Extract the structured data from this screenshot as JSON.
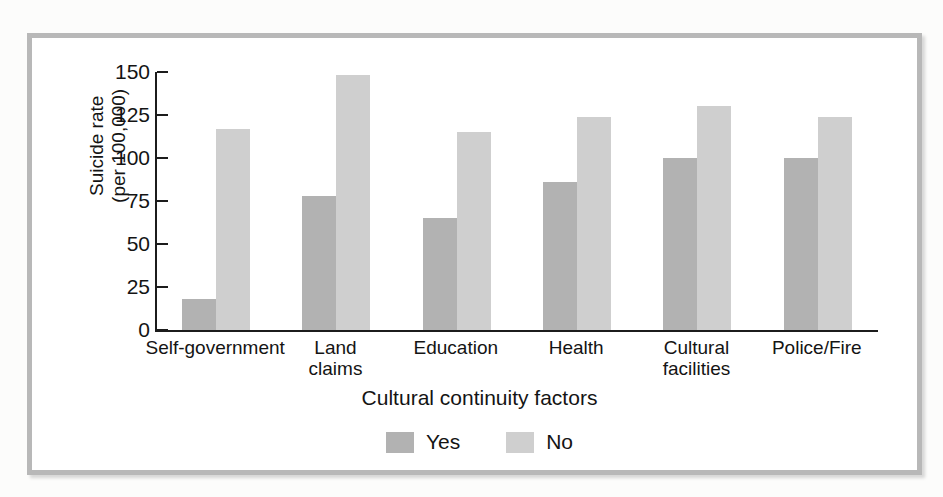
{
  "chart_data": {
    "type": "bar",
    "title": "",
    "xlabel": "Cultural continuity factors",
    "ylabel": "Suicide rate\n(per 100,000)",
    "ylim": [
      0,
      150
    ],
    "yticks": [
      "150",
      "125",
      "100",
      "75",
      "50",
      "25",
      "0"
    ],
    "ytick_values": [
      150,
      125,
      100,
      75,
      50,
      25,
      0
    ],
    "grid": false,
    "legend_position": "bottom-center",
    "categories": [
      "Self-government",
      "Land\nclaims",
      "Education",
      "Health",
      "Cultural\nfacilities",
      "Police/Fire"
    ],
    "series": [
      {
        "name": "Yes",
        "color": "#b2b2b2",
        "values": [
          18,
          78,
          65,
          86,
          100,
          100
        ]
      },
      {
        "name": "No",
        "color": "#cfcfcf",
        "values": [
          117,
          148,
          115,
          124,
          130,
          124
        ]
      }
    ]
  },
  "legend": {
    "items": [
      {
        "label": "Yes",
        "color": "#b2b2b2"
      },
      {
        "label": "No",
        "color": "#cfcfcf"
      }
    ]
  },
  "ghost_text": {
    "top_center": "....",
    "top_right": "....."
  }
}
